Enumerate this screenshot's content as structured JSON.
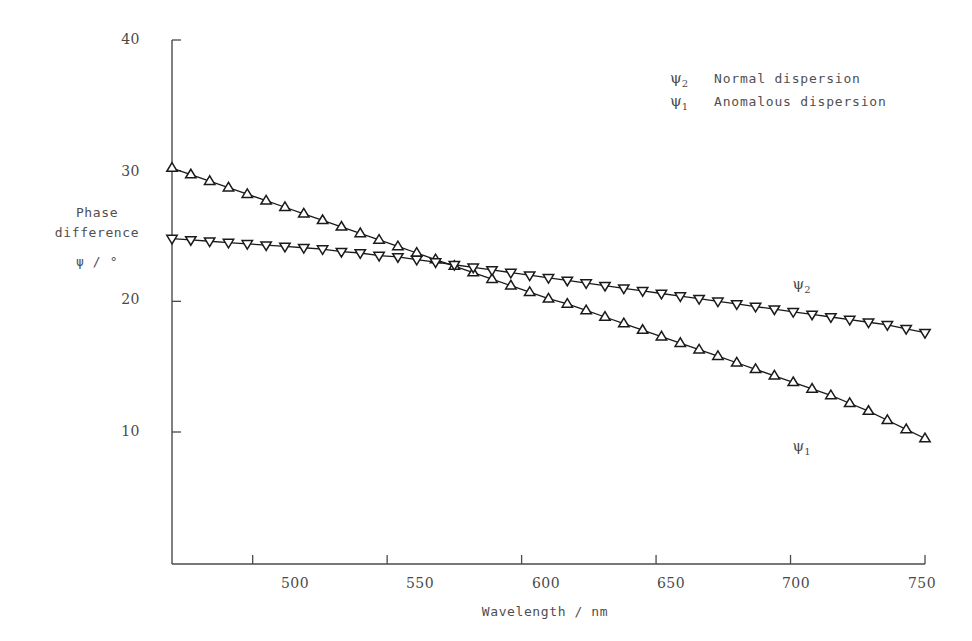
{
  "chart_data": {
    "type": "line",
    "title": "",
    "xlabel": "Wavelength / nm",
    "ylabel_lines": [
      "Phase",
      "difference",
      "ψ / °"
    ],
    "xlim": [
      470,
      750
    ],
    "ylim": [
      6.5,
      40
    ],
    "xticks": [
      500,
      550,
      600,
      650,
      700,
      750
    ],
    "xticklabels": [
      "500",
      "550",
      "600",
      "650",
      "700",
      "750"
    ],
    "yticks": [
      10,
      20,
      30,
      40
    ],
    "yticklabels": [
      "10",
      "20",
      "30",
      "40"
    ],
    "grid": false,
    "legend_position": "upper-right-inside",
    "legend": [
      {
        "symbol": "ψ",
        "subscript": "2",
        "label": "Normal dispersion"
      },
      {
        "symbol": "ψ",
        "subscript": "1",
        "label": "Anomalous dispersion"
      }
    ],
    "annotations": [
      {
        "symbol": "ψ",
        "subscript": "2",
        "x": 703,
        "y": 21.3
      },
      {
        "symbol": "ψ",
        "subscript": "1",
        "x": 703,
        "y": 8.9
      }
    ],
    "series": [
      {
        "name": "ψ₁ Anomalous dispersion",
        "marker": "triangle-up-open",
        "x": [
          470,
          477,
          484,
          491,
          498,
          505,
          512,
          519,
          526,
          533,
          540,
          547,
          554,
          561,
          568,
          575,
          582,
          589,
          596,
          603,
          610,
          617,
          624,
          631,
          638,
          645,
          652,
          659,
          666,
          673,
          680,
          687,
          694,
          701,
          708,
          715,
          722,
          729,
          736,
          743,
          750
        ],
        "y": [
          30.2,
          29.7,
          29.2,
          28.7,
          28.2,
          27.7,
          27.2,
          26.7,
          26.2,
          25.7,
          25.2,
          24.7,
          24.2,
          23.7,
          23.2,
          22.7,
          22.2,
          21.7,
          21.2,
          20.7,
          20.2,
          19.8,
          19.3,
          18.8,
          18.3,
          17.8,
          17.3,
          16.8,
          16.3,
          15.8,
          15.3,
          14.8,
          14.3,
          13.8,
          13.3,
          12.8,
          12.2,
          11.6,
          10.9,
          10.2,
          9.5
        ]
      },
      {
        "name": "ψ₂ Normal dispersion",
        "marker": "triangle-down-open",
        "x": [
          470,
          477,
          484,
          491,
          498,
          505,
          512,
          519,
          526,
          533,
          540,
          547,
          554,
          561,
          568,
          575,
          582,
          589,
          596,
          603,
          610,
          617,
          624,
          631,
          638,
          645,
          652,
          659,
          666,
          673,
          680,
          687,
          694,
          701,
          708,
          715,
          722,
          729,
          736,
          743,
          750
        ],
        "y": [
          24.8,
          24.7,
          24.6,
          24.5,
          24.4,
          24.3,
          24.2,
          24.1,
          24.0,
          23.8,
          23.7,
          23.5,
          23.4,
          23.2,
          23.0,
          22.8,
          22.6,
          22.4,
          22.2,
          22.0,
          21.8,
          21.6,
          21.4,
          21.2,
          21.0,
          20.8,
          20.6,
          20.4,
          20.2,
          20.0,
          19.8,
          19.6,
          19.4,
          19.2,
          19.0,
          18.8,
          18.6,
          18.4,
          18.2,
          17.9,
          17.6
        ]
      }
    ],
    "colors": {
      "axis": "#4a4a4a",
      "series1": "#1a1a1a",
      "series2": "#1a1a1a",
      "background": "#ffffff"
    }
  }
}
